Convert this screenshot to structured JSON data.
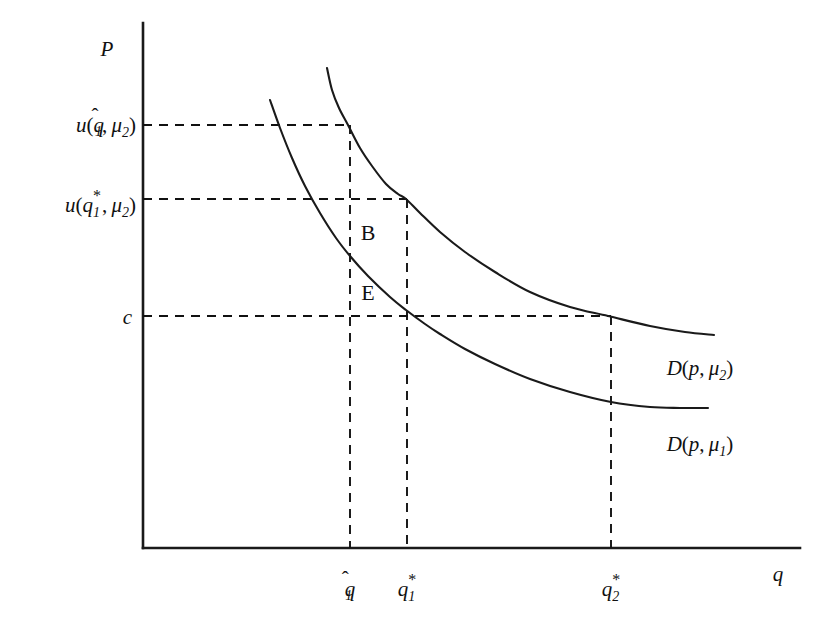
{
  "figure": {
    "type": "economics-demand-diagram",
    "background": "#ffffff",
    "ink_color": "#111111"
  },
  "axes": {
    "y_label": "P",
    "x_label": "q",
    "origin": {
      "x": 143,
      "y": 548
    },
    "y_top": {
      "x": 143,
      "y": 23
    },
    "x_right": {
      "x": 800,
      "y": 548
    }
  },
  "y_ticks": [
    {
      "id": "u-qhat1-mu2",
      "label_main": "u(q",
      "hat": "̂",
      "value_y": 125
    },
    {
      "id": "u-qstar1-mu2",
      "value_y": 199
    },
    {
      "id": "c",
      "label": "c",
      "value_y": 316
    }
  ],
  "labels": {
    "y_axis": "P",
    "x_axis": "q",
    "y_tick_1": "u(q̂₁, μ₂)",
    "y_tick_2": "u(q₁*, μ₂)",
    "y_tick_3": "c",
    "x_tick_1": "q̂₁",
    "x_tick_2": "q₁*",
    "x_tick_3": "q₂*",
    "point_b": "B",
    "point_e": "E",
    "curve_high": "D(p, μ₂)",
    "curve_low": "D(p, μ₁)"
  },
  "chart_data": {
    "type": "line",
    "title": "",
    "xlabel": "q",
    "ylabel": "P",
    "grid": false,
    "legend": "inline-right",
    "axis_pixel_frame": {
      "x0": 143,
      "y0": 548,
      "x1": 800,
      "y1": 23
    },
    "series": [
      {
        "name": "D(p, μ₁)",
        "label": "D(p, μ₁)",
        "label_pos": {
          "x": 700,
          "y": 444
        },
        "description": "Lower demand curve, downward sloping convex hyperbola",
        "points_px": [
          [
            270,
            100
          ],
          [
            280,
            128
          ],
          [
            292,
            158
          ],
          [
            305,
            186
          ],
          [
            320,
            213
          ],
          [
            336,
            238
          ],
          [
            350,
            256
          ],
          [
            368,
            276
          ],
          [
            390,
            297
          ],
          [
            406,
            310
          ],
          [
            425,
            324
          ],
          [
            440,
            334
          ],
          [
            465,
            349
          ],
          [
            495,
            364
          ],
          [
            530,
            379
          ],
          [
            570,
            392
          ],
          [
            611,
            402
          ],
          [
            650,
            407
          ],
          [
            680,
            408
          ],
          [
            708,
            408
          ]
        ]
      },
      {
        "name": "D(p, μ₂)",
        "label": "D(p, μ₂)",
        "label_pos": {
          "x": 700,
          "y": 368
        },
        "description": "Upper demand curve, shifted right of D(p, μ₁)",
        "points_px": [
          [
            327,
            68
          ],
          [
            332,
            90
          ],
          [
            339,
            108
          ],
          [
            348,
            125
          ],
          [
            360,
            148
          ],
          [
            372,
            166
          ],
          [
            386,
            184
          ],
          [
            398,
            194
          ],
          [
            406,
            199
          ],
          [
            420,
            213
          ],
          [
            440,
            232
          ],
          [
            465,
            252
          ],
          [
            495,
            272
          ],
          [
            530,
            292
          ],
          [
            570,
            307
          ],
          [
            608,
            316
          ],
          [
            650,
            326
          ],
          [
            685,
            332
          ],
          [
            714,
            335
          ]
        ]
      }
    ],
    "marked_points": [
      {
        "name": "B",
        "label": "B",
        "px": {
          "x": 368,
          "y": 232
        }
      },
      {
        "name": "E",
        "label": "E",
        "px": {
          "x": 368,
          "y": 292
        }
      }
    ],
    "guides": [
      {
        "id": "h-u-qhat",
        "type": "horizontal",
        "y_px": 125,
        "x_from": 143,
        "x_to": 350
      },
      {
        "id": "h-u-qstar",
        "type": "horizontal",
        "y_px": 199,
        "x_from": 143,
        "x_to": 407
      },
      {
        "id": "h-c",
        "type": "horizontal",
        "y_px": 316,
        "x_from": 143,
        "x_to": 611
      },
      {
        "id": "v-qhat1",
        "type": "vertical",
        "x_px": 350,
        "y_from": 125,
        "y_to": 548
      },
      {
        "id": "v-qstar1",
        "type": "vertical",
        "x_px": 407,
        "y_from": 199,
        "y_to": 548
      },
      {
        "id": "v-qstar2",
        "type": "vertical",
        "x_px": 611,
        "y_from": 316,
        "y_to": 548
      }
    ],
    "x_tick_labels": [
      {
        "label": "q̂₁",
        "x_px": 350,
        "y_px": 588
      },
      {
        "label": "q₁*",
        "x_px": 409,
        "y_px": 588
      },
      {
        "label": "q₂*",
        "x_px": 611,
        "y_px": 588
      }
    ],
    "y_tick_labels": [
      {
        "label": "u(q̂₁, μ₂)",
        "y_px": 125,
        "x_px": 88
      },
      {
        "label": "u(q₁*, μ₂)",
        "y_px": 204,
        "x_px": 88
      },
      {
        "label": "c",
        "y_px": 316,
        "x_px": 124
      }
    ]
  }
}
